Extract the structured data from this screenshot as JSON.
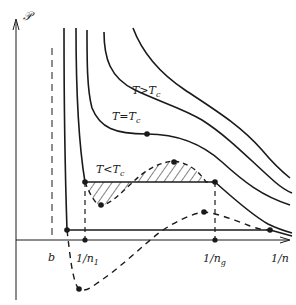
{
  "diagram": {
    "axes": {
      "y_label": "𝒫",
      "x_label": "1/n"
    },
    "markers": {
      "b_label": "b",
      "n1_label": "1/n",
      "n1_sub": "1",
      "n2_label": "1/n",
      "n2_sub": "g"
    },
    "curves": [
      {
        "name": "T>Tc",
        "label_main": "T>T",
        "label_sub": "c"
      },
      {
        "name": "T=Tc",
        "label_main": "T=T",
        "label_sub": "c"
      },
      {
        "name": "T<Tc",
        "label_main": "T<T",
        "label_sub": "c"
      }
    ],
    "colors": {
      "ink": "#1a1a1a",
      "background": "#ffffff"
    }
  }
}
